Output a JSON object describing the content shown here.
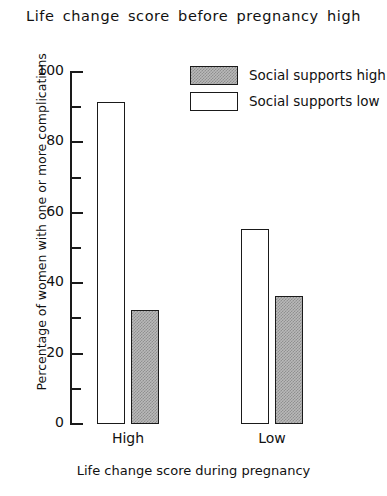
{
  "chart_data": {
    "type": "bar",
    "title": "Life  change  score  before  pregnancy  high",
    "xlabel": "Life change score during pregnancy",
    "ylabel": "Percentage of women with one or more complications",
    "categories": [
      "High",
      "Low"
    ],
    "ylim": [
      0,
      100
    ],
    "ytick_labels": [
      "0",
      "20",
      "40",
      "60",
      "80",
      "100"
    ],
    "ytick_values": [
      0,
      20,
      40,
      60,
      80,
      100
    ],
    "minor_tick_values": [
      10,
      30,
      50,
      70,
      90
    ],
    "grid": false,
    "legend_position": "top-right",
    "series": [
      {
        "name": "Social supports high",
        "style": "hatched",
        "values": [
          32.5,
          36.5
        ]
      },
      {
        "name": "Social supports low",
        "style": "open",
        "values": [
          91.5,
          55.5
        ]
      }
    ]
  },
  "legend": {
    "entries": [
      {
        "label": "Social supports high",
        "style": "hatch"
      },
      {
        "label": "Social supports low",
        "style": "open"
      }
    ]
  },
  "colors": {
    "ink": "#1a1a1a",
    "hatch_fill": "#b9b9b9",
    "open_fill": "#ffffff",
    "background": "#ffffff"
  }
}
